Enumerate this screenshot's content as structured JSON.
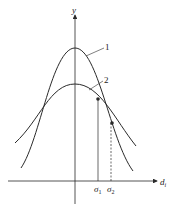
{
  "diagram": {
    "axes": {
      "y_label": "y",
      "x_label_main": "d",
      "x_label_sub": "i"
    },
    "curves": [
      {
        "id": "1",
        "label": "1",
        "description": "narrow tall bell curve"
      },
      {
        "id": "2",
        "label": "2",
        "description": "wide short bell curve"
      }
    ],
    "markers": [
      {
        "label_main": "σ",
        "label_sub": "1",
        "line_style": "solid"
      },
      {
        "label_main": "σ",
        "label_sub": "2",
        "line_style": "dashed"
      }
    ],
    "colors": {
      "stroke": "#2a2a2a",
      "background": "#ffffff"
    }
  }
}
